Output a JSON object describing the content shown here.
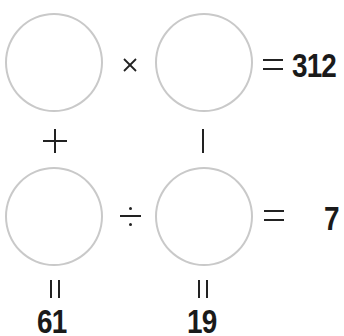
{
  "puzzle": {
    "row1": {
      "operator": "×",
      "operator_name": "multiply",
      "result_sign": "=",
      "result": "312"
    },
    "row2": {
      "operator": "÷",
      "operator_name": "divide",
      "result_sign": "=",
      "result": "7"
    },
    "col1": {
      "operator": "+",
      "operator_name": "plus",
      "result_sign": "=",
      "result": "61"
    },
    "col2": {
      "operator": "−",
      "operator_name": "minus",
      "result_sign": "=",
      "result": "19"
    },
    "cells": [
      {
        "id": "a",
        "value": ""
      },
      {
        "id": "b",
        "value": ""
      },
      {
        "id": "c",
        "value": ""
      },
      {
        "id": "d",
        "value": ""
      }
    ]
  },
  "colors": {
    "circle_stroke": "#c9c9c9",
    "text": "#1a1a1a",
    "background": "#ffffff"
  }
}
